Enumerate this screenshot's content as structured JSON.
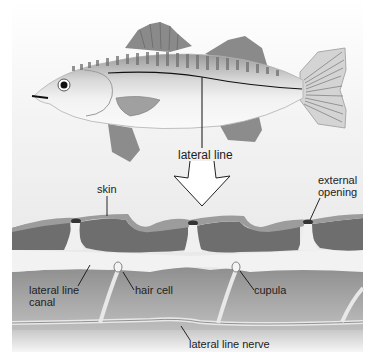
{
  "diagram": {
    "labels": {
      "lateral_line_top": "lateral line",
      "skin": "skin",
      "external_opening_line1": "external",
      "external_opening_line2": "opening",
      "lateral_line_canal_line1": "lateral line",
      "lateral_line_canal_line2": "canal",
      "hair_cell": "hair cell",
      "cupula": "cupula",
      "lateral_line_nerve": "lateral line nerve"
    },
    "colors": {
      "background_top": "#f4f4f4",
      "background_bottom": "#d8d8d8",
      "scale_dark": "#6e6e6e",
      "skin_layer": "#9a9a9a",
      "canal_light": "#efefef",
      "tissue": "#a8a8a8",
      "fin": "#8c8c8c",
      "line": "#111111"
    }
  }
}
